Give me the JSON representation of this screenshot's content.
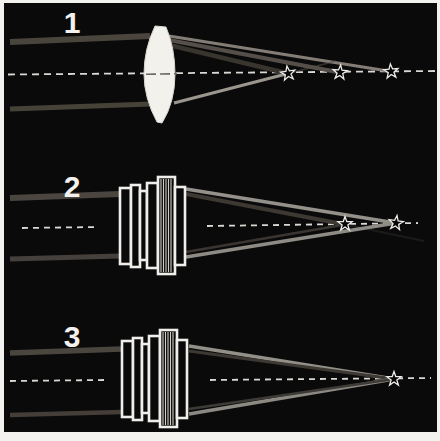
{
  "figure": {
    "background_color": "#0a0a0a",
    "frame_color": "#f3f2ee",
    "outline_color": "#efeeea",
    "axis_color": "#d9d8d3",
    "star_outline_color": "#eeede9"
  },
  "panels": [
    {
      "label": "1",
      "lens_type": "single convex lens",
      "focal_points": 3
    },
    {
      "label": "2",
      "lens_type": "compound lens group",
      "focal_points": 2
    },
    {
      "label": "3",
      "lens_type": "compound lens group",
      "focal_points": 1
    }
  ]
}
